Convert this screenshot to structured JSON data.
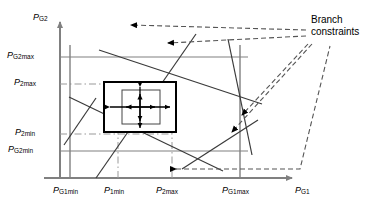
{
  "figure": {
    "type": "feasible-region-diagram",
    "axes": {
      "x": {
        "name": "P",
        "sub": "G1",
        "ticks": [
          {
            "name": "P",
            "sub": "G1min",
            "x": 70
          },
          {
            "name": "P",
            "sub": "1min",
            "x": 118
          },
          {
            "name": "P",
            "sub": "2max",
            "x": 172
          },
          {
            "name": "P",
            "sub": "G1max",
            "x": 240
          }
        ]
      },
      "y": {
        "name": "P",
        "sub": "G2",
        "ticks": [
          {
            "name": "P",
            "sub": "G2max",
            "y": 57
          },
          {
            "name": "P",
            "sub": "2max",
            "y": 84
          },
          {
            "name": "P",
            "sub": "2min",
            "y": 134
          },
          {
            "name": "P",
            "sub": "G2min",
            "y": 151
          }
        ]
      }
    },
    "annotation": {
      "line1": "Branch",
      "line2": "constraints"
    },
    "colors": {
      "axis": "#808080",
      "grid": "#808080",
      "dashdot": "#999999",
      "constraint": "#333333",
      "leader": "#555555",
      "box": "#000000",
      "text": "#000000"
    }
  }
}
